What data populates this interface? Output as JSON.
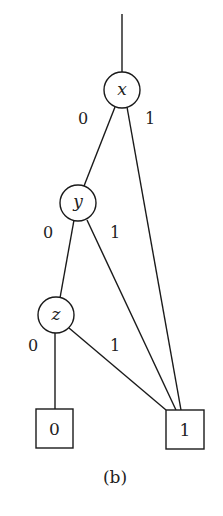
{
  "diagram": {
    "type": "binary decision diagram",
    "caption": "(b)",
    "nodes": {
      "x": {
        "label": "x"
      },
      "y": {
        "label": "y"
      },
      "z": {
        "label": "z"
      }
    },
    "terminals": {
      "t0": {
        "label": "0"
      },
      "t1": {
        "label": "1"
      }
    },
    "edge_labels": {
      "x_low": "0",
      "x_high": "1",
      "y_low": "0",
      "y_high": "1",
      "z_low": "0",
      "z_high": "1"
    },
    "edges": [
      {
        "from": "root",
        "to": "x"
      },
      {
        "from": "x",
        "to": "y",
        "label": "0"
      },
      {
        "from": "x",
        "to": "t1",
        "label": "1"
      },
      {
        "from": "y",
        "to": "z",
        "label": "0"
      },
      {
        "from": "y",
        "to": "t1",
        "label": "1"
      },
      {
        "from": "z",
        "to": "t0",
        "label": "0"
      },
      {
        "from": "z",
        "to": "t1",
        "label": "1"
      }
    ]
  }
}
